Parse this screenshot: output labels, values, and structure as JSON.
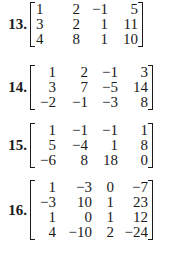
{
  "problems": [
    {
      "number": "13.",
      "rows": [
        [
          "1",
          "2",
          "−1",
          "5"
        ],
        [
          "3",
          "2",
          "1",
          "11"
        ],
        [
          "4",
          "8",
          "1",
          "10"
        ]
      ]
    },
    {
      "number": "14.",
      "rows": [
        [
          "1",
          "2",
          "−1",
          "3"
        ],
        [
          "3",
          "7",
          "−5",
          "14"
        ],
        [
          "−2",
          "−1",
          "−3",
          "8"
        ]
      ]
    },
    {
      "number": "15.",
      "rows": [
        [
          "1",
          "−1",
          "−1",
          "1"
        ],
        [
          "5",
          "−4",
          "1",
          "8"
        ],
        [
          "−6",
          "8",
          "18",
          "0"
        ]
      ]
    },
    {
      "number": "16.",
      "rows": [
        [
          "1",
          "−3",
          "0",
          "−7"
        ],
        [
          "−3",
          "10",
          "1",
          "23"
        ],
        [
          "1",
          "0",
          "1",
          "12"
        ],
        [
          "4",
          "−10",
          "2",
          "−24"
        ]
      ]
    }
  ]
}
